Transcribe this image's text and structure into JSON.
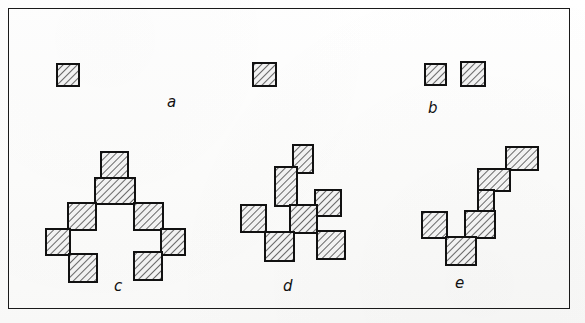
{
  "figure": {
    "kind": "hand-drawn line figure",
    "frame": {
      "x": 8,
      "y": 8,
      "width": 562,
      "height": 301,
      "stroke": "#1a1a1a",
      "stroke_width": 1.6
    },
    "background_color": "#ffffff",
    "square_fill": "#efefef",
    "square_stroke": "#111111",
    "hatch_color": "#3a3a3a"
  },
  "labels": [
    {
      "id": "label-a",
      "text": "a",
      "x": 167,
      "y": 95
    },
    {
      "id": "label-b",
      "text": "b",
      "x": 428,
      "y": 101
    },
    {
      "id": "label-c",
      "text": "c",
      "x": 114,
      "y": 279
    },
    {
      "id": "label-d",
      "text": "d",
      "x": 283,
      "y": 279
    },
    {
      "id": "label-e",
      "text": "e",
      "x": 455,
      "y": 276
    }
  ],
  "clusters": [
    {
      "id": "cluster-a",
      "label": "a",
      "size": 2,
      "note": "two isolated single squares (monomers)",
      "squares": [
        {
          "x": 57,
          "y": 64,
          "w": 22,
          "h": 22
        },
        {
          "x": 253,
          "y": 63,
          "w": 23,
          "h": 23
        }
      ]
    },
    {
      "id": "cluster-b",
      "label": "b",
      "size": 2,
      "note": "two nearby but disjoint single squares",
      "squares": [
        {
          "x": 425,
          "y": 64,
          "w": 21,
          "h": 21
        },
        {
          "x": 461,
          "y": 62,
          "w": 24,
          "h": 24
        }
      ]
    },
    {
      "id": "cluster-c",
      "label": "c",
      "size": 9,
      "note": "symmetric arch / bridge shaped nonomino",
      "squares": [
        {
          "x": 101,
          "y": 152,
          "w": 27,
          "h": 27
        },
        {
          "x": 95,
          "y": 178,
          "w": 40,
          "h": 26
        },
        {
          "x": 68,
          "y": 203,
          "w": 28,
          "h": 27
        },
        {
          "x": 134,
          "y": 203,
          "w": 29,
          "h": 27
        },
        {
          "x": 46,
          "y": 229,
          "w": 24,
          "h": 26
        },
        {
          "x": 161,
          "y": 229,
          "w": 24,
          "h": 26
        },
        {
          "x": 69,
          "y": 254,
          "w": 28,
          "h": 28
        },
        {
          "x": 134,
          "y": 252,
          "w": 28,
          "h": 28
        }
      ]
    },
    {
      "id": "cluster-d",
      "label": "d",
      "size": 8,
      "note": "branched / cross shaped octomino",
      "squares": [
        {
          "x": 293,
          "y": 145,
          "w": 20,
          "h": 28
        },
        {
          "x": 275,
          "y": 167,
          "w": 22,
          "h": 39
        },
        {
          "x": 315,
          "y": 190,
          "w": 26,
          "h": 26
        },
        {
          "x": 241,
          "y": 205,
          "w": 25,
          "h": 27
        },
        {
          "x": 290,
          "y": 205,
          "w": 27,
          "h": 28
        },
        {
          "x": 265,
          "y": 232,
          "w": 29,
          "h": 29
        },
        {
          "x": 317,
          "y": 231,
          "w": 28,
          "h": 28
        }
      ]
    },
    {
      "id": "cluster-e",
      "label": "e",
      "size": 8,
      "note": "zig-zag staircase octomino",
      "squares": [
        {
          "x": 506,
          "y": 147,
          "w": 32,
          "h": 23
        },
        {
          "x": 478,
          "y": 169,
          "w": 32,
          "h": 22
        },
        {
          "x": 478,
          "y": 190,
          "w": 16,
          "h": 22
        },
        {
          "x": 465,
          "y": 211,
          "w": 30,
          "h": 27
        },
        {
          "x": 422,
          "y": 212,
          "w": 25,
          "h": 26
        },
        {
          "x": 446,
          "y": 237,
          "w": 30,
          "h": 28
        }
      ]
    }
  ]
}
